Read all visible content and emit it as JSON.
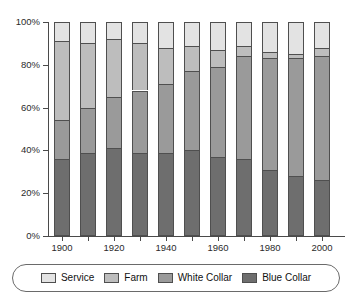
{
  "chart_data": {
    "type": "bar",
    "stacked": true,
    "stack_mode": "percent",
    "title": "",
    "subtitle": "",
    "xlabel": "",
    "ylabel": "",
    "grid": false,
    "legend_position": "bottom",
    "categories": [
      "1900",
      "1910",
      "1920",
      "1930",
      "1940",
      "1950",
      "1960",
      "1970",
      "1980",
      "1990",
      "2000"
    ],
    "x_tick_labels": [
      "1900",
      "1920",
      "1940",
      "1960",
      "1980",
      "2000"
    ],
    "y_tick_labels": [
      "0%",
      "20%",
      "40%",
      "60%",
      "80%",
      "100%"
    ],
    "y_tick_values": [
      0,
      20,
      40,
      60,
      80,
      100
    ],
    "ylim": [
      0,
      100
    ],
    "series": [
      {
        "name": "Blue Collar",
        "color": "#6e6e6e",
        "values": [
          36,
          39,
          41,
          39,
          39,
          40,
          37,
          36,
          31,
          28,
          26
        ]
      },
      {
        "name": "White Collar",
        "color": "#9a9a9a",
        "values": [
          18,
          21,
          24,
          29,
          32,
          37,
          42,
          48,
          52,
          55,
          58
        ]
      },
      {
        "name": "Farm",
        "color": "#bdbdbd",
        "values": [
          37,
          30,
          27,
          22,
          17,
          12,
          8,
          5,
          3,
          2,
          4
        ]
      },
      {
        "name": "Service",
        "color": "#e3e3e3",
        "values": [
          9,
          10,
          8,
          10,
          12,
          11,
          13,
          11,
          14,
          15,
          12
        ]
      }
    ],
    "cumulative_tops": {
      "Blue Collar": [
        36,
        39,
        41,
        39,
        39,
        40,
        37,
        36,
        31,
        28,
        26
      ],
      "White Collar": [
        54,
        60,
        65,
        68,
        71,
        77,
        79,
        84,
        83,
        83,
        84
      ],
      "Farm": [
        91,
        90,
        92,
        90,
        88,
        89,
        87,
        89,
        86,
        85,
        88
      ],
      "Service": [
        100,
        100,
        100,
        100,
        100,
        100,
        100,
        100,
        100,
        100,
        100
      ]
    }
  },
  "legend": {
    "items": [
      {
        "label": "Service",
        "color": "#e3e3e3"
      },
      {
        "label": "Farm",
        "color": "#bdbdbd"
      },
      {
        "label": "White Collar",
        "color": "#9a9a9a"
      },
      {
        "label": "Blue Collar",
        "color": "#6e6e6e"
      }
    ]
  },
  "colors": {
    "axis": "#4a4a4a",
    "border": "#4f4f4f",
    "background": "#ffffff",
    "text": "#1a1a1a"
  }
}
